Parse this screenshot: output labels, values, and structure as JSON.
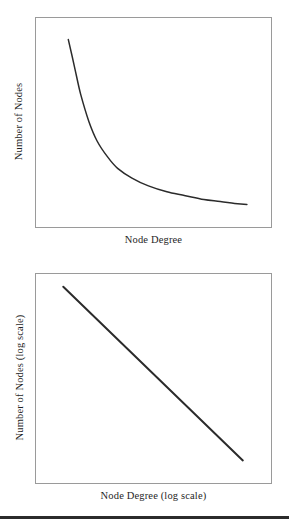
{
  "figure": {
    "background_color": "#ffffff",
    "axis_border_color": "#9a9a9a",
    "curve_color": "#2b2b2b",
    "rule_color": "#2b2b2b"
  },
  "panels": {
    "top": {
      "xlabel": "Node Degree",
      "ylabel": "Number of Nodes"
    },
    "bottom": {
      "xlabel": "Node Degree (log scale)",
      "ylabel": "Number of Nodes (log scale)"
    }
  },
  "chart_data": [
    {
      "type": "line",
      "title": "",
      "subtitle": "",
      "xlabel": "Node Degree",
      "ylabel": "Number of Nodes",
      "scale": "linear",
      "grid": false,
      "legend": null,
      "axis_ticks": {
        "x": [],
        "y": []
      },
      "xlim": [
        0,
        1
      ],
      "ylim": [
        0,
        1
      ],
      "description": "Heavy-tailed power-law degree distribution on linear axes: steep decay from a high peak at low degree, flattening into a long tail at high degree.",
      "series": [
        {
          "name": "degree distribution",
          "x": [
            0.09,
            0.12,
            0.15,
            0.19,
            0.23,
            0.28,
            0.33,
            0.4,
            0.48,
            0.57,
            0.66,
            0.75,
            0.83,
            0.9,
            0.96
          ],
          "y": [
            0.92,
            0.78,
            0.64,
            0.5,
            0.4,
            0.32,
            0.26,
            0.21,
            0.17,
            0.14,
            0.12,
            0.1,
            0.09,
            0.08,
            0.075
          ]
        }
      ]
    },
    {
      "type": "line",
      "title": "",
      "subtitle": "",
      "xlabel": "Node Degree (log scale)",
      "ylabel": "Number of Nodes (log scale)",
      "scale": "log-log",
      "grid": false,
      "legend": null,
      "axis_ticks": {
        "x": [],
        "y": []
      },
      "xlim": [
        0,
        1
      ],
      "ylim": [
        0,
        1
      ],
      "description": "The same power-law distribution plotted on log-log axes appears as a straight line with negative slope.",
      "series": [
        {
          "name": "degree distribution (log-log)",
          "x": [
            0.065,
            0.94
          ],
          "y": [
            0.965,
            0.075
          ]
        }
      ]
    }
  ]
}
